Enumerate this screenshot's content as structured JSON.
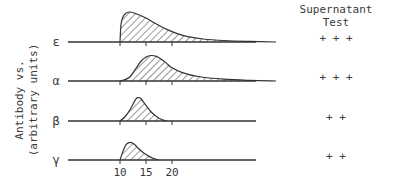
{
  "chart_data": {
    "type": "area",
    "title": "",
    "ylabel_lines": [
      "Antibody vs.",
      "(arbitrary units)"
    ],
    "xlabel": "",
    "x_ticks": [
      10,
      15,
      20
    ],
    "xlim": [
      0,
      45
    ],
    "right_header_lines": [
      "Supernatant",
      "Test"
    ],
    "series": [
      {
        "name": "ε",
        "supernatant": "+ + +",
        "onset": 10,
        "peak_x": 11.5,
        "peak_height": 1.0,
        "end": 40,
        "points": [
          [
            10,
            0
          ],
          [
            10.2,
            0.6
          ],
          [
            10.6,
            0.85
          ],
          [
            11.2,
            0.97
          ],
          [
            12,
            1.0
          ],
          [
            13,
            0.95
          ],
          [
            15,
            0.8
          ],
          [
            17,
            0.6
          ],
          [
            19,
            0.42
          ],
          [
            21,
            0.28
          ],
          [
            23,
            0.18
          ],
          [
            26,
            0.1
          ],
          [
            30,
            0.05
          ],
          [
            35,
            0.02
          ],
          [
            40,
            0
          ]
        ]
      },
      {
        "name": "α",
        "supernatant": "+ + +",
        "onset": 10,
        "peak_x": 16,
        "peak_height": 0.85,
        "end": 40,
        "points": [
          [
            10,
            0
          ],
          [
            11,
            0.05
          ],
          [
            12,
            0.15
          ],
          [
            13,
            0.4
          ],
          [
            14,
            0.65
          ],
          [
            15,
            0.8
          ],
          [
            16,
            0.85
          ],
          [
            17,
            0.82
          ],
          [
            18,
            0.72
          ],
          [
            19,
            0.58
          ],
          [
            20,
            0.44
          ],
          [
            22,
            0.28
          ],
          [
            25,
            0.15
          ],
          [
            30,
            0.06
          ],
          [
            35,
            0.02
          ],
          [
            40,
            0
          ]
        ]
      },
      {
        "name": "β",
        "supernatant": "+ +",
        "onset": 10,
        "peak_x": 13.5,
        "peak_height": 0.78,
        "end": 19,
        "points": [
          [
            10,
            0
          ],
          [
            11,
            0.15
          ],
          [
            12,
            0.4
          ],
          [
            13,
            0.72
          ],
          [
            13.5,
            0.78
          ],
          [
            14,
            0.75
          ],
          [
            15,
            0.52
          ],
          [
            16,
            0.3
          ],
          [
            17,
            0.15
          ],
          [
            18,
            0.05
          ],
          [
            19,
            0
          ]
        ]
      },
      {
        "name": "γ",
        "supernatant": "+ +",
        "onset": 10,
        "peak_x": 12,
        "peak_height": 0.68,
        "end": 17.5,
        "points": [
          [
            10,
            0
          ],
          [
            10.6,
            0.35
          ],
          [
            11.2,
            0.6
          ],
          [
            12,
            0.68
          ],
          [
            12.8,
            0.6
          ],
          [
            13.5,
            0.45
          ],
          [
            14.5,
            0.28
          ],
          [
            15.5,
            0.15
          ],
          [
            16.5,
            0.06
          ],
          [
            17.5,
            0
          ]
        ]
      }
    ]
  }
}
